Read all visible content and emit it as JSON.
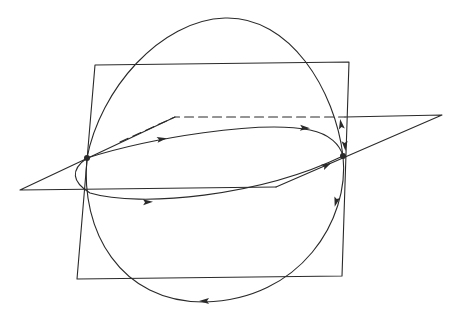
{
  "diagram": {
    "width": 456,
    "height": 317,
    "background": "#ffffff",
    "stroke_color": "#2a2a2a",
    "stroke_width": 1.1,
    "dash_pattern": "9 5",
    "elements": {
      "vertical_plane": {
        "points": [
          [
            95,
            65
          ],
          [
            349,
            62
          ],
          [
            342,
            276
          ],
          [
            77,
            279
          ]
        ]
      },
      "horizontal_plane_visible": {
        "points": [
          [
            276,
            187
          ],
          [
            20,
            190
          ],
          [
            175,
            117
          ]
        ]
      },
      "horizontal_plane_right_edge": {
        "points": [
          [
            345,
            117
          ],
          [
            442,
            115
          ],
          [
            276,
            187
          ]
        ]
      },
      "horizontal_plane_hidden_edge": {
        "points": [
          [
            120,
            142
          ],
          [
            175,
            117
          ],
          [
            345,
            117
          ]
        ],
        "dashed": true
      },
      "great_circle": {
        "path": "M 87 158 C 100 90, 160 20, 225 18 C 290 16, 335 90, 343 156 C 350 220, 300 300, 205 302 C 120 303, 80 230, 87 158 Z"
      },
      "loop_upper": {
        "path": "M 87 158 C 150 138, 260 120, 310 130 C 330 134, 340 145, 343 156"
      },
      "loop_lower": {
        "path": "M 87 158 C 70 170, 72 182, 90 193 C 140 208, 260 196, 343 156"
      },
      "loop_lower_tail": {
        "path": "M 87 158 C 115 150, 135 146, 160 142"
      },
      "marked_points": [
        {
          "name": "left-intersection-point",
          "x": 87,
          "y": 158,
          "r": 3
        },
        {
          "name": "right-intersection-point",
          "x": 343,
          "y": 156,
          "r": 3
        }
      ],
      "arrows": [
        {
          "name": "arrow-upper-loop-left",
          "x": 162,
          "y": 139,
          "angle": -10
        },
        {
          "name": "arrow-upper-loop-right",
          "x": 305,
          "y": 128,
          "angle": 4
        },
        {
          "name": "arrow-right-descending",
          "x": 345,
          "y": 146,
          "angle": 85
        },
        {
          "name": "arrow-right-ascending",
          "x": 341,
          "y": 124,
          "angle": -100
        },
        {
          "name": "arrow-lower-loop",
          "x": 148,
          "y": 202,
          "angle": -3
        },
        {
          "name": "arrow-right-lower",
          "x": 336,
          "y": 202,
          "angle": 105
        },
        {
          "name": "arrow-circle-bottom",
          "x": 204,
          "y": 301,
          "angle": 180
        },
        {
          "name": "arrow-loop-right-entry",
          "x": 327,
          "y": 165,
          "angle": -28
        }
      ]
    }
  }
}
